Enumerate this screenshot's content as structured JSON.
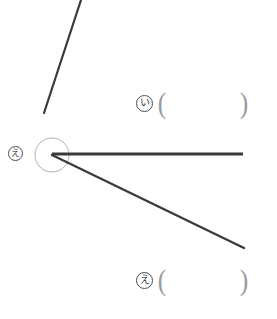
{
  "page": {
    "background_color": "#ffffff",
    "width": 277,
    "height": 319
  },
  "figure": {
    "name": "angle-diagram",
    "stroke_color": "#3a3a3a",
    "arc_color": "#b0b0b0",
    "vertex": {
      "x": 52,
      "y": 155
    },
    "arc": {
      "cx": 52,
      "cy": 155,
      "r": 17
    },
    "rays": [
      {
        "name": "upper-ray",
        "x1": 44,
        "y1": 113,
        "x2": 81,
        "y2": 0,
        "width": 2.2
      },
      {
        "name": "horizontal-ray",
        "x1": 52,
        "y1": 154,
        "x2": 243,
        "y2": 154,
        "width": 3
      },
      {
        "name": "lower-ray",
        "x1": 52,
        "y1": 155,
        "x2": 244,
        "y2": 248,
        "width": 2.4
      }
    ]
  },
  "labels": {
    "vertex": {
      "mark": "え",
      "name": "vertex-angle-label"
    }
  },
  "answers": [
    {
      "mark": "い",
      "open_paren": "(",
      "value": "",
      "close_paren": ")"
    },
    {
      "mark": "え",
      "open_paren": "(",
      "value": "",
      "close_paren": ")"
    }
  ]
}
